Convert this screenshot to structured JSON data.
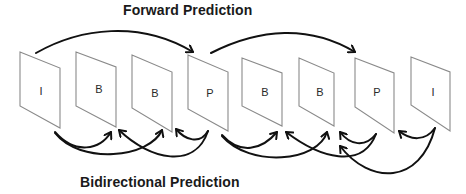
{
  "titles": {
    "top": "Forward Prediction",
    "bottom": "Bidirectional Prediction"
  },
  "frames": [
    {
      "label": "I",
      "type": "intra"
    },
    {
      "label": "B",
      "type": "bidirectional"
    },
    {
      "label": "B",
      "type": "bidirectional"
    },
    {
      "label": "P",
      "type": "predicted"
    },
    {
      "label": "B",
      "type": "bidirectional"
    },
    {
      "label": "B",
      "type": "bidirectional"
    },
    {
      "label": "P",
      "type": "predicted"
    },
    {
      "label": "I",
      "type": "intra"
    }
  ],
  "forward_arrows": [
    {
      "from": 0,
      "to": 3
    },
    {
      "from": 3,
      "to": 6
    }
  ],
  "bidirectional_arrows": [
    {
      "from": 0,
      "to": 1
    },
    {
      "from": 0,
      "to": 2
    },
    {
      "from": 3,
      "to": 1
    },
    {
      "from": 3,
      "to": 2
    },
    {
      "from": 3,
      "to": 4
    },
    {
      "from": 3,
      "to": 5
    },
    {
      "from": 6,
      "to": 4
    },
    {
      "from": 6,
      "to": 5
    },
    {
      "from": 7,
      "to": 5
    },
    {
      "from": 7,
      "to": 6
    }
  ],
  "colors": {
    "frame_stroke": "#8a8a8a",
    "arrow": "#111111",
    "text": "#1a1a1a",
    "background": "#ffffff"
  }
}
